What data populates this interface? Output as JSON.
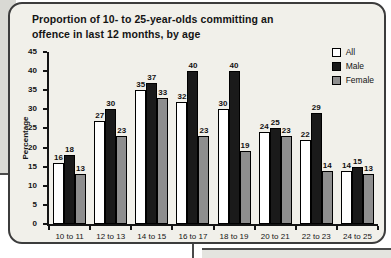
{
  "page": {
    "background": "#ffffff",
    "decoration_colors": {
      "left_panel": "#d9d9d4",
      "bottom_panel": "#e4e4df",
      "connector_line": "#4a4a4a"
    }
  },
  "card": {
    "background": "#f1f0ea",
    "border_color": "#3c3c3c"
  },
  "chart_data": {
    "type": "bar",
    "title": "Proportion of 10- to 25-year-olds committing an offence in last 12 months, by age",
    "ylabel": "Percentage",
    "xlabel": "",
    "ylim": [
      0,
      45
    ],
    "yticks": [
      0,
      5,
      10,
      15,
      20,
      25,
      30,
      35,
      40,
      45
    ],
    "grid": false,
    "legend_position": "top-right",
    "value_labels": true,
    "categories": [
      "10 to 11",
      "12 to 13",
      "14 to 15",
      "16 to 17",
      "18 to 19",
      "20 to 21",
      "22 to 23",
      "24 to 25"
    ],
    "series": [
      {
        "name": "All",
        "color": "#ffffff",
        "values": [
          16,
          27,
          35,
          32,
          30,
          24,
          22,
          14
        ]
      },
      {
        "name": "Male",
        "color": "#1a1a1a",
        "values": [
          18,
          30,
          37,
          40,
          40,
          25,
          29,
          15
        ]
      },
      {
        "name": "Female",
        "color": "#8e8e8e",
        "values": [
          13,
          23,
          33,
          23,
          19,
          23,
          14,
          13
        ]
      }
    ]
  }
}
